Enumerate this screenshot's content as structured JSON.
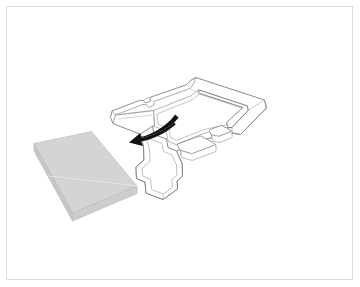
{
  "figure": {
    "kind": "assembly-instruction-illustration",
    "frame": {
      "visible": true,
      "stroke_color": "#dcdcdc",
      "background_color": "#ffffff",
      "inset_px": 6
    },
    "alt_text": "Isometric assembly illustration: a flat gray foam panel at left and an L-shaped white molded tray at right, with a curved black arrow indicating the panel is inserted into the tray.",
    "objects": [
      {
        "id": "gray-panel",
        "label": "gray-foam-panel",
        "description": "Flat rectangular slab drawn in isometric view with a visible side thickness and a faint diagonal crease across the top face.",
        "top_face_color": "#d4d4d4",
        "side_face_color": "#c4c4c4",
        "edge_color": "#bfbfbf",
        "crease_color": "#e8e8e8"
      },
      {
        "id": "white-tray",
        "label": "l-shaped-molded-tray",
        "description": "Outlined white L-shaped tray with raised walls, a notched left arm, a long right rail and two rounded bosses inside the cavity.",
        "fill_color": "#ffffff",
        "stroke_color": "#6e6e6e",
        "inner_stroke_color": "#8a8a8a"
      },
      {
        "id": "boss-large",
        "label": "large-rounded-boss",
        "fill_color": "#ffffff",
        "stroke_color": "#7a7a7a"
      },
      {
        "id": "boss-small",
        "label": "small-rounded-boss",
        "fill_color": "#ffffff",
        "stroke_color": "#7a7a7a"
      },
      {
        "id": "motion-arrow",
        "label": "curved-insertion-arrow",
        "description": "Tapered curved arrow sweeping from the right down to the lower left, indicating direction of insertion.",
        "color": "#111111"
      }
    ]
  }
}
